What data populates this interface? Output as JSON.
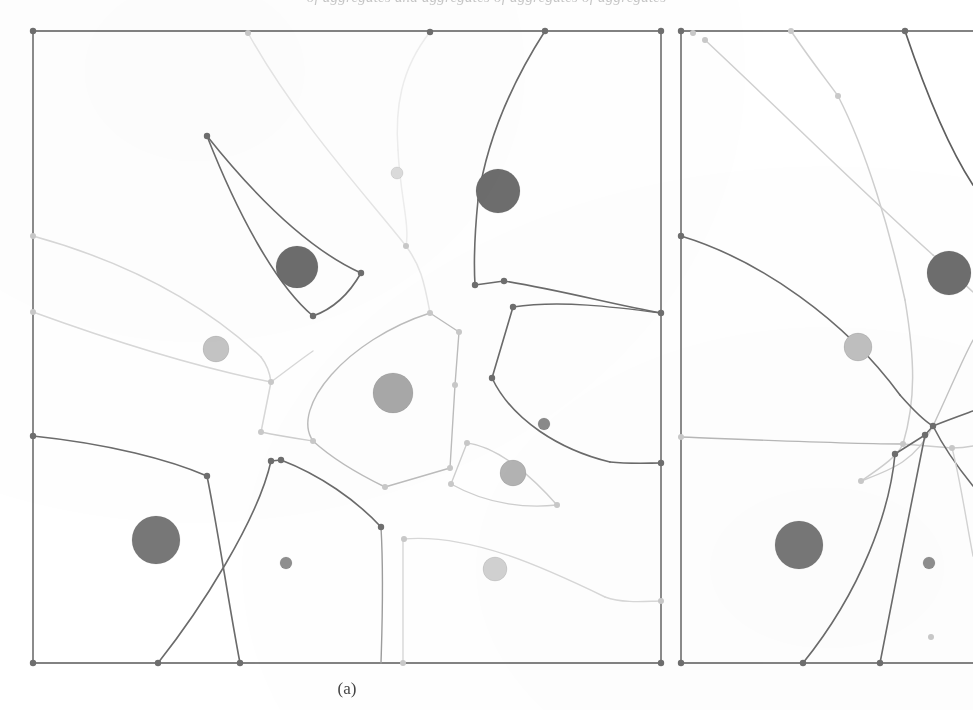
{
  "page": {
    "width": 973,
    "height": 710,
    "background_color": "#ffffff",
    "clipped_header_text": "of aggregates and aggregates of aggregates of aggregates",
    "caption_a": "(a)"
  },
  "style": {
    "frame_color": "#5a5a5a",
    "vertex_color_dark": "#6e6e6e",
    "vertex_color_light": "#c9c9c9",
    "edge_dark": "#6b6b6b",
    "edge_mid": "#9d9d9d",
    "edge_light": "#cfcfcf",
    "edge_faint": "#e2e2e2"
  },
  "chart_data": {
    "type": "diagram",
    "title": "",
    "subtitle": "",
    "xlabel": "",
    "ylabel": "",
    "legend": [],
    "panels": [
      {
        "id": "a",
        "label": "(a)",
        "frame": {
          "x": 33,
          "y": 31,
          "width": 628,
          "height": 632
        },
        "sites": [
          {
            "id": "a1",
            "cx": 297,
            "cy": 267,
            "r": 21,
            "fill": "#6d6d6d",
            "size_class": "large"
          },
          {
            "id": "a2",
            "cx": 498,
            "cy": 191,
            "r": 22,
            "fill": "#6d6d6d",
            "size_class": "large"
          },
          {
            "id": "a3",
            "cx": 156,
            "cy": 540,
            "r": 24,
            "fill": "#777777",
            "size_class": "large"
          },
          {
            "id": "a4",
            "cx": 393,
            "cy": 393,
            "r": 20,
            "fill": "#a8a8a8",
            "size_class": "large"
          },
          {
            "id": "a5",
            "cx": 216,
            "cy": 349,
            "r": 13,
            "fill": "#c4c4c4",
            "size_class": "medium"
          },
          {
            "id": "a6",
            "cx": 513,
            "cy": 473,
            "r": 13,
            "fill": "#b4b4b4",
            "size_class": "medium"
          },
          {
            "id": "a7",
            "cx": 495,
            "cy": 569,
            "r": 12,
            "fill": "#d2d2d2",
            "size_class": "medium"
          },
          {
            "id": "a8",
            "cx": 544,
            "cy": 424,
            "r": 6,
            "fill": "#8a8a8a",
            "size_class": "small"
          },
          {
            "id": "a9",
            "cx": 286,
            "cy": 563,
            "r": 6,
            "fill": "#8f8f8f",
            "size_class": "small"
          },
          {
            "id": "a10",
            "cx": 397,
            "cy": 173,
            "r": 6,
            "fill": "#dcdcdc",
            "size_class": "small"
          }
        ],
        "vertices": [
          {
            "x": 33,
            "y": 31,
            "tone": "dark"
          },
          {
            "x": 248,
            "y": 33,
            "tone": "light"
          },
          {
            "x": 430,
            "y": 32,
            "tone": "dark"
          },
          {
            "x": 545,
            "y": 31,
            "tone": "dark"
          },
          {
            "x": 661,
            "y": 31,
            "tone": "dark"
          },
          {
            "x": 207,
            "y": 136,
            "tone": "dark"
          },
          {
            "x": 361,
            "y": 273,
            "tone": "dark"
          },
          {
            "x": 313,
            "y": 316,
            "tone": "dark"
          },
          {
            "x": 406,
            "y": 246,
            "tone": "light"
          },
          {
            "x": 475,
            "y": 285,
            "tone": "dark"
          },
          {
            "x": 504,
            "y": 281,
            "tone": "dark"
          },
          {
            "x": 33,
            "y": 236,
            "tone": "light"
          },
          {
            "x": 33,
            "y": 312,
            "tone": "light"
          },
          {
            "x": 271,
            "y": 382,
            "tone": "light"
          },
          {
            "x": 261,
            "y": 432,
            "tone": "light"
          },
          {
            "x": 430,
            "y": 313,
            "tone": "light"
          },
          {
            "x": 459,
            "y": 332,
            "tone": "light"
          },
          {
            "x": 455,
            "y": 385,
            "tone": "light"
          },
          {
            "x": 450,
            "y": 468,
            "tone": "light"
          },
          {
            "x": 385,
            "y": 487,
            "tone": "light"
          },
          {
            "x": 313,
            "y": 441,
            "tone": "light"
          },
          {
            "x": 513,
            "y": 307,
            "tone": "dark"
          },
          {
            "x": 492,
            "y": 378,
            "tone": "dark"
          },
          {
            "x": 661,
            "y": 313,
            "tone": "dark"
          },
          {
            "x": 33,
            "y": 436,
            "tone": "dark"
          },
          {
            "x": 207,
            "y": 476,
            "tone": "dark"
          },
          {
            "x": 271,
            "y": 461,
            "tone": "dark"
          },
          {
            "x": 281,
            "y": 460,
            "tone": "dark"
          },
          {
            "x": 381,
            "y": 527,
            "tone": "dark"
          },
          {
            "x": 467,
            "y": 443,
            "tone": "light"
          },
          {
            "x": 451,
            "y": 484,
            "tone": "light"
          },
          {
            "x": 557,
            "y": 505,
            "tone": "light"
          },
          {
            "x": 404,
            "y": 539,
            "tone": "light"
          },
          {
            "x": 661,
            "y": 463,
            "tone": "dark"
          },
          {
            "x": 661,
            "y": 601,
            "tone": "light"
          },
          {
            "x": 33,
            "y": 663,
            "tone": "dark"
          },
          {
            "x": 158,
            "y": 663,
            "tone": "dark"
          },
          {
            "x": 240,
            "y": 663,
            "tone": "dark"
          },
          {
            "x": 403,
            "y": 663,
            "tone": "light"
          },
          {
            "x": 661,
            "y": 663,
            "tone": "dark"
          }
        ],
        "edges": [
          {
            "d": "M 33 31 L 661 31",
            "stroke": "#5a5a5a",
            "width": 1.4
          },
          {
            "d": "M 661 31 L 661 663",
            "stroke": "#5a5a5a",
            "width": 1.4
          },
          {
            "d": "M 661 663 L 33 663",
            "stroke": "#5a5a5a",
            "width": 1.4
          },
          {
            "d": "M 33 663 L 33 31",
            "stroke": "#5a5a5a",
            "width": 1.4
          },
          {
            "d": "M 248 33 C 296 120 370 200 406 246",
            "stroke": "#e6e6e6",
            "width": 1.5
          },
          {
            "d": "M 406 246 C 420 265 424 280 430 313",
            "stroke": "#e6e6e6",
            "width": 1.5
          },
          {
            "d": "M 430 32 C 400 70 395 110 398 150",
            "stroke": "#eeeeee",
            "width": 1.5
          },
          {
            "d": "M 398 150 C 400 195 410 225 406 246",
            "stroke": "#eeeeee",
            "width": 1.5
          },
          {
            "d": "M 207 136 C 258 200 310 250 361 273",
            "stroke": "#6b6b6b",
            "width": 1.6
          },
          {
            "d": "M 207 136 C 238 215 276 285 313 316",
            "stroke": "#6b6b6b",
            "width": 1.6
          },
          {
            "d": "M 361 273 C 348 296 330 310 313 316",
            "stroke": "#6b6b6b",
            "width": 1.6
          },
          {
            "d": "M 545 31 C 520 70 488 130 478 200",
            "stroke": "#6b6b6b",
            "width": 1.6
          },
          {
            "d": "M 478 200 C 474 240 474 268 475 285",
            "stroke": "#6b6b6b",
            "width": 1.6
          },
          {
            "d": "M 475 285 L 504 281",
            "stroke": "#6b6b6b",
            "width": 1.6
          },
          {
            "d": "M 504 281 C 560 290 615 305 661 313",
            "stroke": "#6b6b6b",
            "width": 1.6
          },
          {
            "d": "M 33 236 C 120 260 200 300 261 357",
            "stroke": "#d8d8d8",
            "width": 1.5
          },
          {
            "d": "M 261 357 C 268 366 270 374 271 382",
            "stroke": "#d8d8d8",
            "width": 1.5
          },
          {
            "d": "M 33 312 C 110 340 190 366 271 382",
            "stroke": "#d8d8d8",
            "width": 1.5
          },
          {
            "d": "M 271 382 L 261 432",
            "stroke": "#d8d8d8",
            "width": 1.5
          },
          {
            "d": "M 261 432 C 280 436 300 439 313 441",
            "stroke": "#cfcfcf",
            "width": 1.5
          },
          {
            "d": "M 430 313 L 459 332",
            "stroke": "#bdbdbd",
            "width": 1.4
          },
          {
            "d": "M 459 332 L 455 385",
            "stroke": "#bdbdbd",
            "width": 1.4
          },
          {
            "d": "M 455 385 L 450 468",
            "stroke": "#bdbdbd",
            "width": 1.4
          },
          {
            "d": "M 450 468 L 385 487",
            "stroke": "#bdbdbd",
            "width": 1.4
          },
          {
            "d": "M 385 487 C 350 470 325 452 313 441",
            "stroke": "#bdbdbd",
            "width": 1.4
          },
          {
            "d": "M 313 441 C 290 408 346 340 430 313",
            "stroke": "#bdbdbd",
            "width": 1.4
          },
          {
            "d": "M 271 382 C 290 368 300 360 313 351",
            "stroke": "#d8d8d8",
            "width": 1.4
          },
          {
            "d": "M 513 307 L 492 378",
            "stroke": "#6b6b6b",
            "width": 1.6
          },
          {
            "d": "M 513 307 C 560 300 615 307 661 313",
            "stroke": "#6b6b6b",
            "width": 1.5
          },
          {
            "d": "M 492 378 C 512 420 560 450 610 462",
            "stroke": "#6b6b6b",
            "width": 1.6
          },
          {
            "d": "M 610 462 C 630 464 648 463 661 463",
            "stroke": "#6b6b6b",
            "width": 1.6
          },
          {
            "d": "M 33 436 C 110 444 170 460 207 476",
            "stroke": "#6b6b6b",
            "width": 1.6
          },
          {
            "d": "M 207 476 C 218 530 228 600 240 663",
            "stroke": "#6b6b6b",
            "width": 1.6
          },
          {
            "d": "M 271 461 C 258 520 200 610 158 663",
            "stroke": "#6b6b6b",
            "width": 1.6
          },
          {
            "d": "M 281 460 C 320 475 356 500 381 527",
            "stroke": "#6b6b6b",
            "width": 1.6
          },
          {
            "d": "M 381 527 C 384 580 382 630 381 663",
            "stroke": "#9d9d9d",
            "width": 1.4
          },
          {
            "d": "M 467 443 C 500 447 535 480 557 505",
            "stroke": "#cfcfcf",
            "width": 1.4
          },
          {
            "d": "M 467 443 L 451 484",
            "stroke": "#cfcfcf",
            "width": 1.4
          },
          {
            "d": "M 451 484 C 490 506 530 508 557 505",
            "stroke": "#cfcfcf",
            "width": 1.4
          },
          {
            "d": "M 403 539 C 470 533 545 568 605 597",
            "stroke": "#d8d8d8",
            "width": 1.4
          },
          {
            "d": "M 605 597 C 625 604 648 601 661 601",
            "stroke": "#d8d8d8",
            "width": 1.4
          },
          {
            "d": "M 403 539 L 403 663",
            "stroke": "#d8d8d8",
            "width": 1.4
          },
          {
            "d": "M 271 461 L 281 460",
            "stroke": "#6b6b6b",
            "width": 1.5
          }
        ]
      },
      {
        "id": "b",
        "label": "",
        "frame": {
          "x": 681,
          "y": 31,
          "width": 292,
          "height": 632
        },
        "clipped_right_edge": true,
        "sites": [
          {
            "id": "b1",
            "cx": 949,
            "cy": 273,
            "r": 22,
            "fill": "#6d6d6d",
            "size_class": "large"
          },
          {
            "id": "b2",
            "cx": 799,
            "cy": 545,
            "r": 24,
            "fill": "#777777",
            "size_class": "large"
          },
          {
            "id": "b3",
            "cx": 858,
            "cy": 347,
            "r": 14,
            "fill": "#c0c0c0",
            "size_class": "medium"
          },
          {
            "id": "b4",
            "cx": 929,
            "cy": 563,
            "r": 6,
            "fill": "#8f8f8f",
            "size_class": "small"
          }
        ],
        "vertices": [
          {
            "x": 681,
            "y": 31,
            "tone": "dark"
          },
          {
            "x": 693,
            "y": 33,
            "tone": "light"
          },
          {
            "x": 705,
            "y": 40,
            "tone": "light"
          },
          {
            "x": 791,
            "y": 31,
            "tone": "light"
          },
          {
            "x": 838,
            "y": 96,
            "tone": "light"
          },
          {
            "x": 905,
            "y": 31,
            "tone": "dark"
          },
          {
            "x": 681,
            "y": 236,
            "tone": "dark"
          },
          {
            "x": 681,
            "y": 437,
            "tone": "light"
          },
          {
            "x": 933,
            "y": 426,
            "tone": "dark"
          },
          {
            "x": 925,
            "y": 435,
            "tone": "dark"
          },
          {
            "x": 895,
            "y": 454,
            "tone": "dark"
          },
          {
            "x": 903,
            "y": 444,
            "tone": "light"
          },
          {
            "x": 952,
            "y": 448,
            "tone": "light"
          },
          {
            "x": 861,
            "y": 481,
            "tone": "light"
          },
          {
            "x": 931,
            "y": 637,
            "tone": "light"
          },
          {
            "x": 681,
            "y": 663,
            "tone": "dark"
          },
          {
            "x": 803,
            "y": 663,
            "tone": "dark"
          },
          {
            "x": 880,
            "y": 663,
            "tone": "dark"
          }
        ],
        "edges": [
          {
            "d": "M 681 31 L 973 31",
            "stroke": "#5a5a5a",
            "width": 1.4
          },
          {
            "d": "M 681 663 L 973 663",
            "stroke": "#5a5a5a",
            "width": 1.4
          },
          {
            "d": "M 681 31 L 681 663",
            "stroke": "#5a5a5a",
            "width": 1.4
          },
          {
            "d": "M 705 40 C 780 110 860 190 933 255",
            "stroke": "#d0d0d0",
            "width": 1.5
          },
          {
            "d": "M 933 255 C 952 272 965 285 973 292",
            "stroke": "#d0d0d0",
            "width": 1.5
          },
          {
            "d": "M 791 31 C 812 62 828 82 838 96",
            "stroke": "#cfcfcf",
            "width": 1.5
          },
          {
            "d": "M 838 96 C 866 150 890 230 905 300",
            "stroke": "#cfcfcf",
            "width": 1.5
          },
          {
            "d": "M 905 300 C 915 360 916 400 903 444",
            "stroke": "#cfcfcf",
            "width": 1.5
          },
          {
            "d": "M 905 31 C 925 90 950 150 973 185",
            "stroke": "#5f5f5f",
            "width": 1.7
          },
          {
            "d": "M 681 236 C 760 260 845 320 900 395",
            "stroke": "#6b6b6b",
            "width": 1.6
          },
          {
            "d": "M 900 395 C 915 412 926 422 933 426",
            "stroke": "#6b6b6b",
            "width": 1.6
          },
          {
            "d": "M 933 426 C 948 420 962 415 973 411",
            "stroke": "#6b6b6b",
            "width": 1.6
          },
          {
            "d": "M 681 437 C 760 440 850 444 903 444",
            "stroke": "#b8b8b8",
            "width": 1.4
          },
          {
            "d": "M 903 444 L 952 448",
            "stroke": "#cfcfcf",
            "width": 1.4
          },
          {
            "d": "M 952 448 C 962 448 968 447 973 446",
            "stroke": "#cfcfcf",
            "width": 1.4
          },
          {
            "d": "M 861 481 C 885 465 898 455 903 444",
            "stroke": "#cfcfcf",
            "width": 1.4
          },
          {
            "d": "M 861 481 C 890 470 915 462 933 426",
            "stroke": "#cfcfcf",
            "width": 1.4
          },
          {
            "d": "M 895 454 L 925 435",
            "stroke": "#6b6b6b",
            "width": 1.5
          },
          {
            "d": "M 925 435 L 933 426",
            "stroke": "#6b6b6b",
            "width": 1.5
          },
          {
            "d": "M 895 454 C 890 510 862 590 803 663",
            "stroke": "#6b6b6b",
            "width": 1.6
          },
          {
            "d": "M 925 435 C 912 500 894 590 880 663",
            "stroke": "#6b6b6b",
            "width": 1.6
          },
          {
            "d": "M 933 426 C 945 450 960 470 973 486",
            "stroke": "#6b6b6b",
            "width": 1.6
          },
          {
            "d": "M 952 448 C 960 478 966 520 973 556",
            "stroke": "#d4d4d4",
            "width": 1.4
          },
          {
            "d": "M 933 426 C 950 390 962 360 973 340",
            "stroke": "#c4c4c4",
            "width": 1.4
          }
        ]
      }
    ]
  }
}
